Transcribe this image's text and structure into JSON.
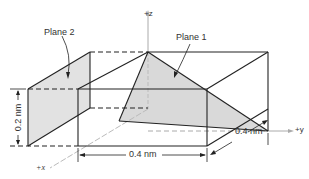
{
  "figure": {
    "labels": {
      "plane1": "Plane 1",
      "plane2": "Plane 2",
      "axis_z": "+z",
      "axis_y": "+y",
      "axis_x": "+x",
      "dim_height": "0.2 nm",
      "dim_width": "0.4 nm",
      "dim_depth": "0.4 nm"
    },
    "colors": {
      "line": "#222222",
      "shade": "#dcdcdc",
      "axis": "#aaaaaa"
    }
  }
}
